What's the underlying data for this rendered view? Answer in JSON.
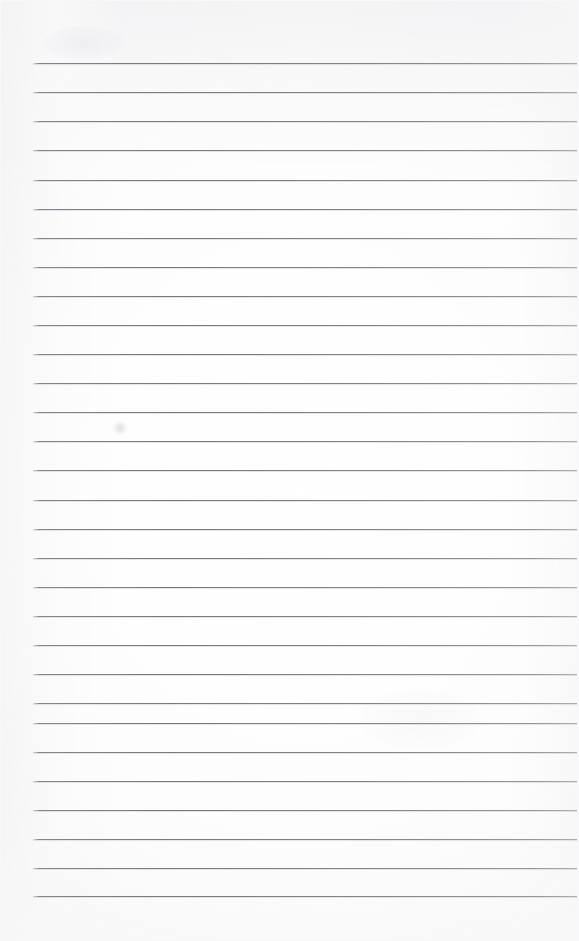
{
  "document": {
    "kind": "ruled-notebook-page",
    "title": "Blank lined page",
    "page_width": 579,
    "page_height": 941,
    "text_content": "",
    "has_handwriting": false,
    "has_printed_text": false,
    "background_color": "#fcfcfc",
    "rule_color": "#7e7e88",
    "rule_count": 29,
    "rule_left_x": 33,
    "rule_right_x": 577,
    "rule_spacing": 29,
    "first_rule_y": 63,
    "last_rule_y": 896,
    "margins": {
      "top": 63,
      "left": 33,
      "right": 2,
      "bottom": 45
    },
    "artifacts": [
      {
        "name": "faint-smudge",
        "x": 120,
        "y": 430
      }
    ],
    "rules": [
      {
        "index": 1,
        "y": 63
      },
      {
        "index": 2,
        "y": 92
      },
      {
        "index": 3,
        "y": 121
      },
      {
        "index": 4,
        "y": 150
      },
      {
        "index": 5,
        "y": 180
      },
      {
        "index": 6,
        "y": 209
      },
      {
        "index": 7,
        "y": 238
      },
      {
        "index": 8,
        "y": 267
      },
      {
        "index": 9,
        "y": 296
      },
      {
        "index": 10,
        "y": 325
      },
      {
        "index": 11,
        "y": 354
      },
      {
        "index": 12,
        "y": 383
      },
      {
        "index": 13,
        "y": 412
      },
      {
        "index": 14,
        "y": 441
      },
      {
        "index": 15,
        "y": 470
      },
      {
        "index": 16,
        "y": 500
      },
      {
        "index": 17,
        "y": 529
      },
      {
        "index": 18,
        "y": 558
      },
      {
        "index": 19,
        "y": 587
      },
      {
        "index": 20,
        "y": 616
      },
      {
        "index": 21,
        "y": 645
      },
      {
        "index": 22,
        "y": 674
      },
      {
        "index": 23,
        "y": 703
      },
      {
        "index": 24,
        "y": 723
      },
      {
        "index": 25,
        "y": 752
      },
      {
        "index": 26,
        "y": 781
      },
      {
        "index": 27,
        "y": 810
      },
      {
        "index": 28,
        "y": 839
      },
      {
        "index": 29,
        "y": 868
      },
      {
        "index": 30,
        "y": 896
      }
    ]
  }
}
